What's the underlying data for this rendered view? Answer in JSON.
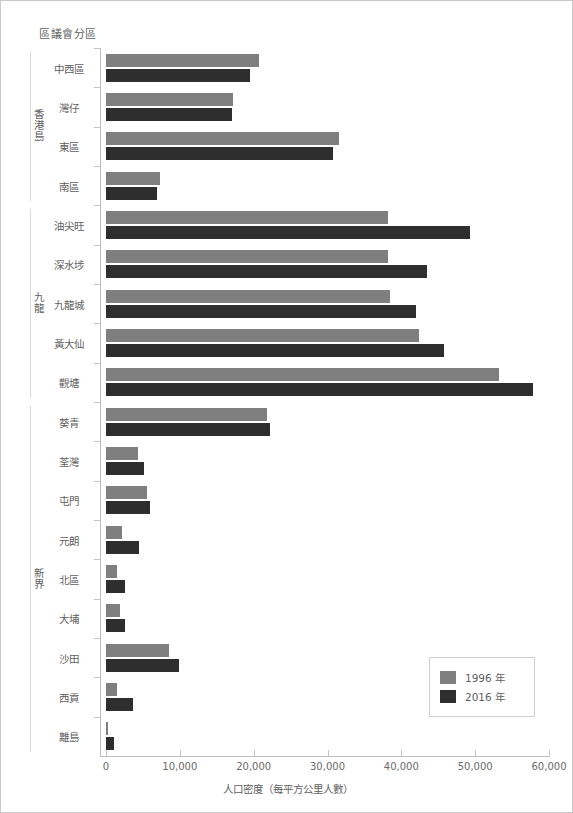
{
  "chart_data": {
    "type": "bar",
    "orientation": "horizontal",
    "title": "",
    "xlabel": "人口密度（每平方公里人數）",
    "ylabel": "區議會分區",
    "xlim": [
      0,
      60000
    ],
    "xticks": [
      "0",
      "10,000",
      "20,000",
      "30,000",
      "40,000",
      "50,000",
      "60,000"
    ],
    "xtick_values": [
      0,
      10000,
      20000,
      30000,
      40000,
      50000,
      60000
    ],
    "grid": false,
    "legend_position": "bottom-right",
    "categories": [
      "中西區",
      "灣仔",
      "東區",
      "南區",
      "油尖旺",
      "深水埗",
      "九龍城",
      "黃大仙",
      "觀塘",
      "葵青",
      "荃灣",
      "屯門",
      "元朗",
      "北區",
      "大埔",
      "沙田",
      "西貢",
      "離島"
    ],
    "groups": [
      {
        "label": "香港島",
        "categories": [
          "中西區",
          "灣仔",
          "東區",
          "南區"
        ]
      },
      {
        "label": "九龍",
        "categories": [
          "油尖旺",
          "深水埗",
          "九龍城",
          "黃大仙",
          "觀塘"
        ]
      },
      {
        "label": "新界",
        "categories": [
          "葵青",
          "荃灣",
          "屯門",
          "元朗",
          "北區",
          "大埔",
          "沙田",
          "西貢",
          "離島"
        ]
      }
    ],
    "series": [
      {
        "name": "1996 年",
        "color": "#7f7f7f",
        "values": [
          20700,
          17250,
          31600,
          7350,
          38200,
          38200,
          38400,
          42450,
          53200,
          21750,
          4380,
          5550,
          2150,
          1450,
          1900,
          8580,
          1450,
          250
        ]
      },
      {
        "name": "2016 年",
        "color": "#2e2e2e",
        "values": [
          19500,
          17050,
          30700,
          6950,
          49300,
          43450,
          42000,
          45800,
          57850,
          22250,
          5150,
          5900,
          4430,
          2570,
          2570,
          9900,
          3620,
          1100
        ]
      }
    ]
  },
  "legend": {
    "items": [
      {
        "label": "1996 年",
        "color": "#7f7f7f"
      },
      {
        "label": "2016 年",
        "color": "#2e2e2e"
      }
    ]
  },
  "colors": {
    "series_1996": "#7f7f7f",
    "series_2016": "#2e2e2e",
    "axis": "#bdbdbd",
    "text": "#5f5f5f",
    "border": "#c9c9c9"
  }
}
